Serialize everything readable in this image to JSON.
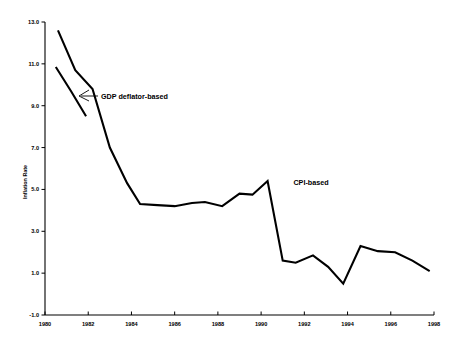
{
  "chart_data": {
    "type": "line",
    "title": "",
    "xlabel": "",
    "ylabel": "Inflation Rate",
    "xlim": [
      1980,
      1998
    ],
    "ylim": [
      -1.0,
      13.0
    ],
    "grid": false,
    "legend": "none",
    "x_ticks": [
      "1980",
      "1982",
      "1984",
      "1986",
      "1988",
      "1990",
      "1992",
      "1994",
      "1996",
      "1998"
    ],
    "x_tick_values": [
      1980,
      1982,
      1984,
      1986,
      1988,
      1990,
      1992,
      1994,
      1996,
      1998
    ],
    "y_ticks": [
      "-1.0",
      "1.0",
      "3.0",
      "5.0",
      "7.0",
      "9.0",
      "11.0",
      "13.0"
    ],
    "y_tick_values": [
      -1.0,
      1.0,
      3.0,
      5.0,
      7.0,
      9.0,
      11.0,
      13.0
    ],
    "series": [
      {
        "name": "CPI-based",
        "x": [
          1980.6,
          1981.4,
          1982.2,
          1983.0,
          1983.8,
          1984.4,
          1985.2,
          1986.0,
          1986.8,
          1987.4,
          1988.2,
          1989.0,
          1989.6,
          1990.3,
          1991.0,
          1991.6,
          1992.4,
          1993.1,
          1993.8,
          1994.6,
          1995.4,
          1996.2,
          1997.0,
          1997.8
        ],
        "y": [
          12.6,
          10.7,
          9.8,
          7.0,
          5.3,
          4.3,
          4.25,
          4.2,
          4.35,
          4.4,
          4.2,
          4.8,
          4.75,
          5.4,
          1.6,
          1.5,
          1.85,
          1.3,
          0.5,
          2.3,
          2.05,
          2.0,
          1.6,
          1.1
        ]
      },
      {
        "name": "GDP deflator-based",
        "x": [
          1980.5,
          1981.2,
          1981.9
        ],
        "y": [
          10.85,
          9.7,
          8.5
        ]
      }
    ],
    "annotations": [
      {
        "text": "GDP deflator-based",
        "x": 1982.7,
        "y": 9.6
      },
      {
        "text": "CPI-based",
        "x": 1991.6,
        "y": 5.8
      }
    ]
  }
}
